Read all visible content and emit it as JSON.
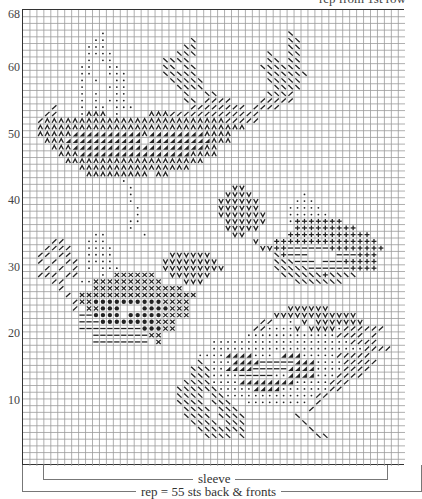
{
  "header": {
    "note": "rep from 1st row"
  },
  "chart_data": {
    "type": "table",
    "rows": 68,
    "columns": 55,
    "y_tick_labels": [
      "68",
      "60",
      "50",
      "40",
      "30",
      "20",
      "10"
    ],
    "y_ticks": [
      68,
      60,
      50,
      40,
      30,
      20,
      10
    ],
    "grid": true,
    "legend_symbols": {
      "o": "small-dot",
      "b": "backslash",
      "f": "forward-slash",
      "^": "inverted-v",
      "t": "half-filled-triangle",
      "v": "v",
      "+": "plus",
      "-": "dash",
      "x": "cross",
      "O": "filled-dot"
    },
    "cells_top_to_bottom": [
      ".......................................................",
      ".......................................................",
      ".......................................................",
      "...........o..........................b................",
      "..........oo............b.............bb...............",
      ".........ooo...........bb.............bb...............",
      ".........oooo.........bbb..........b..bb...............",
      ".........o.oo.......bbbb...........bb.bb...............",
      "........oo..oo......bb.bb.........bbbbbb...............",
      "........oo..ooo.....bbbbb..........bbbbbb..............",
      "........o.o..oo......bbbbb.........bbbbb...............",
      "........o...ooo.......bbbb..........bbbb...............",
      "........o.o..oo........b..bb.......bbbf................",
      "........o.o.ooo........bb.ffff....fffff................",
      "....f...o.oo.ooo........ffffffff.ffff..................",
      "...ff...o^^^.o....^^^fffffffffffff.....................",
      "..f^^^^^^^^^^^^^^^^^^^^^^^^^^fffff.....................",
      "..^^^^^^^^^^^^^^^^^^^^^^^^^^^^^^.......................",
      "..^^^^^tttttttttt^tttttttt^^^^.........................",
      "...^^^ttttttttttt.ttttttttt^^^.........................",
      "....^^^ttttttttttttttttttt^^...........................",
      ".....^^^tttttttttttttttt^^^^...........................",
      "......^^^^^^^^^^^^^^^^^^^^.............................",
      "........^^^^^^^^^^^^^^^^...............................",
      ".........^^^^^^^^^.^^..................................",
      "..............o........................................",
      "...............o..............vv.......................",
      "...............o.............vvvv.......o..............",
      "...............o............vvvvvv.....ooo.............",
      "................o...........vvvvvv....ooooo............",
      "................o...........vvvvvvv...oooooo...........",
      "...............oo............vvvvvv...o+++++++.........",
      "...............o.............vvvvv.....+++++++++.......",
      "..........oo.....o............vv......++++++++++++.....",
      "....ff...ooo.....................v..+++++++++++++++....",
      "...ffff..oooo.....................vv++------++++++++...",
      "..ff.ff..oooo........vvvvvv.........b+---....---+++....",
      "..f.f.ff.oooo.......vvvvvvvv........bbb---.---+++++....",
      "...f.f.f.o.ooo......vvvvvvvvv.......bbbbb------++++....",
      "..fff.ff...o.xxxxxx..vvvvvv..........bbbbbb+bbbb.......",
      "....ff..ooxxxxxxxxxx...vvv.............bbbbbbb.........",
      ".....f....xxxxxxxxxxxxx..............................",
      "......f.xxxxxxxxxxxxxxxxx..............................",
      ".......fxxOOOOOOOOOOxxxx...............................",
      ".......f.xxOOO...OOOOxxx..............vvvvvv...........",
      "........--OOOO.OOOOOxxxx............vvvvvvvvvvvv.......",
      "........---OOOOOOOOxxx............ff..o.v.vvvvvvv......",
      "........---------OOOxx...........ffoooov.vvvvoffffff...",
      "..........--------xx............oooooooooooooffff.f....",
      "..........--------.x.......ooooooooooooooooooooffff....",
      "...........................ooooooooooooooooooooooffff..",
      ".........................oooottttooo.tttooooofffff.....",
      ".........................b.oootttt-----tttoooofffff....",
      "........................bbbootttt-----ttttooooffff.....",
      "........................bbboooo-----oottttoooffff......",
      ".......................bbbboooottttttttooooofff........",
      "......................bbbbbbooooottttoooooooff.........",
      "......................bbbb.bboooooooooooooff...........",
      "......................bbbb.bbb..ooooooooo.f............",
      ".......................bbbb.bbb..........f.............",
      ".......................bbbb.bbbb.......b...............",
      "........................bbbb.bbb........b..............",
      ".........................bbbbbbb.........b.............",
      "..........................bbbb.b..........bb...........",
      ".......................................................",
      ".......................................................",
      ".......................................................",
      "......................................................."
    ]
  },
  "brackets": {
    "sleeve_label": "sleeve",
    "rep_label": "rep = 55 sts  back & fronts"
  },
  "colors": {
    "grid_line": "#9a9a9a",
    "border": "#333333",
    "symbol": "#222222"
  }
}
